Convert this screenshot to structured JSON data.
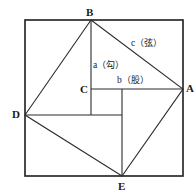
{
  "figure": {
    "stroke_color": "#2b2b2b",
    "background_color": "#ffffff",
    "outer_square": {
      "left": 25,
      "top": 20,
      "right": 183,
      "bottom": 176,
      "stroke_width": 1.6
    },
    "inner_square_vertices": {
      "B": {
        "x": 91,
        "y": 20
      },
      "A": {
        "x": 183,
        "y": 89
      },
      "E": {
        "x": 122,
        "y": 176
      },
      "D": {
        "x": 25,
        "y": 115
      }
    },
    "point_C": {
      "x": 91,
      "y": 89
    },
    "small_square": {
      "left": 91,
      "top": 89,
      "right": 122,
      "bottom": 115
    },
    "segments": [
      {
        "name": "B-to-C-vertical",
        "x1": 91,
        "y1": 20,
        "x2": 91,
        "y2": 115
      },
      {
        "name": "C-to-A-horizontal",
        "x1": 91,
        "y1": 89,
        "x2": 183,
        "y2": 89
      },
      {
        "name": "D-to-right-horizontal",
        "x1": 25,
        "y1": 115,
        "x2": 122,
        "y2": 115
      },
      {
        "name": "top-to-E-vertical",
        "x1": 122,
        "y1": 89,
        "x2": 122,
        "y2": 176
      }
    ]
  },
  "labels": {
    "vertices": [
      {
        "id": "B",
        "text": "B"
      },
      {
        "id": "A",
        "text": "A"
      },
      {
        "id": "D",
        "text": "D"
      },
      {
        "id": "E",
        "text": "E"
      },
      {
        "id": "C",
        "text": "C"
      }
    ],
    "sides": [
      {
        "id": "c",
        "latin": "c",
        "cjk": "（弦）",
        "full": "c（弦）"
      },
      {
        "id": "a",
        "latin": "a",
        "cjk": "（勾）",
        "full": "a（勾）"
      },
      {
        "id": "b",
        "latin": "b",
        "cjk": "（股）",
        "full": "b（股）"
      }
    ]
  }
}
